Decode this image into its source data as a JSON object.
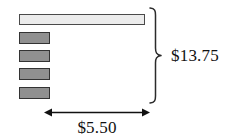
{
  "diagram": {
    "type": "tape-diagram",
    "bars": {
      "whole": {
        "name": "total-bar",
        "fill": "#ececec",
        "stroke": "#4a4a4a",
        "represents": "13.75"
      },
      "parts": {
        "count": 4,
        "fill": "#909090",
        "stroke": "#333333",
        "represents": "5.50"
      }
    },
    "brace": {
      "icon": "right-curly-brace-icon",
      "orientation": "right",
      "label": "$13.75",
      "color": "#222222"
    },
    "dimension": {
      "icon": "double-headed-arrow-icon",
      "orientation": "horizontal",
      "label": "$5.50",
      "color": "#111111"
    },
    "values": {
      "total": "$13.75",
      "part": "$5.50"
    }
  }
}
